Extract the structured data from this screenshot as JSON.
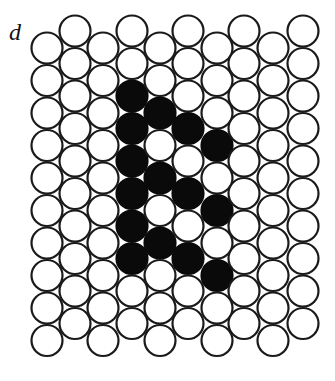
{
  "figure": {
    "panel_label": "d",
    "colors": {
      "filled": "#0a0a0a",
      "empty": "#ffffff",
      "stroke": "#1a1a1a"
    },
    "grid": {
      "columns": 10,
      "rows": 10,
      "radius": 15.5,
      "row_spacing": 32.5,
      "column_x": [
        47,
        75,
        103,
        132,
        160,
        188,
        217,
        244,
        273,
        303
      ],
      "column_y_start": [
        48,
        31,
        48,
        31,
        48,
        31,
        48,
        31,
        48,
        31
      ]
    },
    "filled_cells": [
      {
        "col": 4,
        "row": 3
      },
      {
        "col": 4,
        "row": 4
      },
      {
        "col": 4,
        "row": 5
      },
      {
        "col": 4,
        "row": 6
      },
      {
        "col": 4,
        "row": 7
      },
      {
        "col": 4,
        "row": 8
      },
      {
        "col": 5,
        "row": 3
      },
      {
        "col": 5,
        "row": 5
      },
      {
        "col": 5,
        "row": 7
      },
      {
        "col": 6,
        "row": 4
      },
      {
        "col": 6,
        "row": 6
      },
      {
        "col": 6,
        "row": 8
      },
      {
        "col": 7,
        "row": 4
      },
      {
        "col": 7,
        "row": 6
      },
      {
        "col": 7,
        "row": 8
      }
    ]
  }
}
